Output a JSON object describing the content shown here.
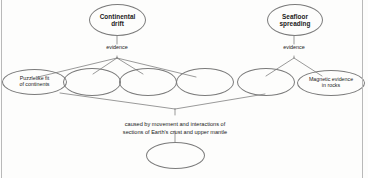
{
  "diagram": {
    "type": "concept-map",
    "nodes": [
      {
        "id": "continental-drift",
        "label": "Continental\ndrift",
        "text_visible": true
      },
      {
        "id": "seafloor-spreading",
        "label": "Seafloor\nspreading",
        "text_visible": true
      },
      {
        "id": "puzzlelike-fit",
        "label": "Puzzlelike fit\nof continents",
        "text_visible": true
      },
      {
        "id": "blank-evidence-1",
        "label": "",
        "text_visible": false
      },
      {
        "id": "blank-evidence-2",
        "label": "",
        "text_visible": false
      },
      {
        "id": "blank-evidence-3",
        "label": "",
        "text_visible": false
      },
      {
        "id": "blank-evidence-4",
        "label": "",
        "text_visible": false
      },
      {
        "id": "magnetic-evidence",
        "label": "Magnetic evidence\nin rocks",
        "text_visible": true
      },
      {
        "id": "blank-result",
        "label": "",
        "text_visible": false
      }
    ],
    "edge_labels": {
      "left": "evidence",
      "right": "evidence"
    },
    "caption": "caused by movement and interactions of\nsections of Earth's crust and upper mantle"
  },
  "colors": {
    "outline": "#7b7b7b",
    "text": "#1a1a1a",
    "background": "#fdfdfc",
    "rule": "#b9b9b9"
  }
}
